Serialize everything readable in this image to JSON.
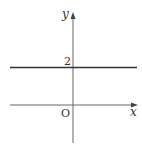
{
  "diagram": {
    "type": "coordinate-graph",
    "axes": {
      "x_label": "x",
      "y_label": "y",
      "origin_label": "O"
    },
    "line": {
      "equation": "y = 2",
      "y_intercept_label": "2"
    },
    "colors": {
      "axis": "#555555",
      "line": "#333333",
      "text": "#333333"
    }
  }
}
